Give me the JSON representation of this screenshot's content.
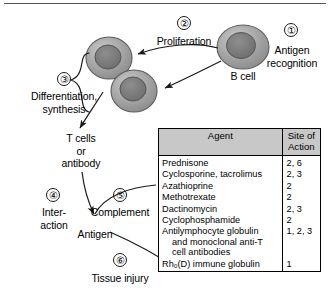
{
  "figure": {
    "steps": [
      {
        "num": "①",
        "label": "Antigen\nrecognition"
      },
      {
        "num": "②",
        "label": "Proliferation"
      },
      {
        "num": "③",
        "label": "Differentiation,\nsynthesis"
      },
      {
        "num": "④",
        "label": "Inter-\naction"
      },
      {
        "num": "⑤",
        "label": "Complement"
      },
      {
        "num": "⑥",
        "label": "Tissue injury"
      }
    ],
    "cell_label": "B cell",
    "product_label": "T cells\nor\nantibody",
    "antigen_label": "Antigen",
    "cell_fill": "#9a9a9a",
    "nucleus_fill": "#767676",
    "header_fill": "#c8c8c8"
  },
  "table": {
    "headers": [
      "Agent",
      "Site of\nAction"
    ],
    "rows": [
      {
        "agent": "Prednisone",
        "agent_cont": [],
        "site": "2, 6"
      },
      {
        "agent": "Cyclosporine, tacrolimus",
        "agent_cont": [],
        "site": "2, 3"
      },
      {
        "agent": "Azathioprine",
        "agent_cont": [],
        "site": "2"
      },
      {
        "agent": "Methotrexate",
        "agent_cont": [],
        "site": "2"
      },
      {
        "agent": "Dactinomycin",
        "agent_cont": [],
        "site": "2, 3"
      },
      {
        "agent": "Cyclophosphamide",
        "agent_cont": [],
        "site": "2"
      },
      {
        "agent": "Antilymphocyte globulin",
        "agent_cont": [
          "and monoclonal anti-T",
          "cell antibodies"
        ],
        "site": "1, 2, 3"
      },
      {
        "agent": "Rh₀(D) immune globulin",
        "agent_cont": [],
        "site": "1"
      }
    ]
  }
}
